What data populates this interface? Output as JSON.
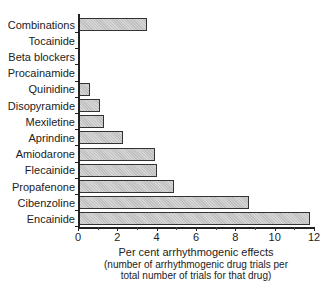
{
  "chart_data": {
    "type": "bar",
    "orientation": "horizontal",
    "title": "",
    "categories": [
      "Combinations",
      "Tocainide",
      "Beta blockers",
      "Procainamide",
      "Quinidine",
      "Disopyramide",
      "Mexiletine",
      "Aprindine",
      "Amiodarone",
      "Flecainide",
      "Propafenone",
      "Cibenzoline",
      "Encainide"
    ],
    "values": [
      3.5,
      0,
      0,
      0,
      0.6,
      1.1,
      1.3,
      2.3,
      3.9,
      4.0,
      4.9,
      8.7,
      11.8
    ],
    "xlabel": "Per cent arrhythmogenic effects",
    "xlabel_sub": [
      "(number of arrhythmogenic drug trials per",
      "total number of trials for that drug)"
    ],
    "ylabel": "",
    "xlim": [
      0,
      12
    ],
    "xticks": [
      "0",
      "2",
      "4",
      "6",
      "8",
      "10",
      "12"
    ],
    "grid": false,
    "legend": null
  }
}
